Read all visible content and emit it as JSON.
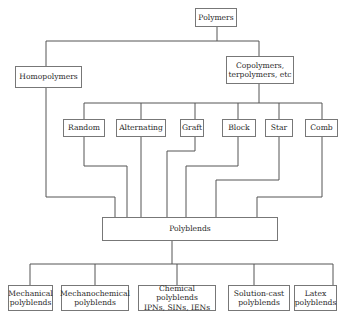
{
  "diagram": {
    "root": {
      "label": "Polymers"
    },
    "level1": [
      {
        "label": "Homopolymers"
      },
      {
        "label": "Copolymers,\nterpolymers, etc"
      }
    ],
    "copolymer_types": [
      {
        "label": "Random"
      },
      {
        "label": "Alternating"
      },
      {
        "label": "Graft"
      },
      {
        "label": "Block"
      },
      {
        "label": "Star"
      },
      {
        "label": "Comb"
      }
    ],
    "hub": {
      "label": "Polyblends"
    },
    "polyblend_types": [
      {
        "label": "Mechanical\npolyblends"
      },
      {
        "label": "Mechanochemical\npolyblends"
      },
      {
        "label": "Chemical polyblends\nIPNs, SINs, IENs"
      },
      {
        "label": "Solution-cast\npolyblends"
      },
      {
        "label": "Latex\npolyblends"
      }
    ],
    "edges": [
      [
        "Polymers",
        "Homopolymers"
      ],
      [
        "Polymers",
        "Copolymers, terpolymers, etc"
      ],
      [
        "Copolymers, terpolymers, etc",
        "Random"
      ],
      [
        "Copolymers, terpolymers, etc",
        "Alternating"
      ],
      [
        "Copolymers, terpolymers, etc",
        "Graft"
      ],
      [
        "Copolymers, terpolymers, etc",
        "Block"
      ],
      [
        "Copolymers, terpolymers, etc",
        "Star"
      ],
      [
        "Copolymers, terpolymers, etc",
        "Comb"
      ],
      [
        "Homopolymers",
        "Polyblends"
      ],
      [
        "Random",
        "Polyblends"
      ],
      [
        "Alternating",
        "Polyblends"
      ],
      [
        "Graft",
        "Polyblends"
      ],
      [
        "Block",
        "Polyblends"
      ],
      [
        "Star",
        "Polyblends"
      ],
      [
        "Comb",
        "Polyblends"
      ],
      [
        "Polyblends",
        "Mechanical polyblends"
      ],
      [
        "Polyblends",
        "Mechanochemical polyblends"
      ],
      [
        "Polyblends",
        "Chemical polyblends IPNs, SINs, IENs"
      ],
      [
        "Polyblends",
        "Solution-cast polyblends"
      ],
      [
        "Polyblends",
        "Latex polyblends"
      ]
    ]
  }
}
